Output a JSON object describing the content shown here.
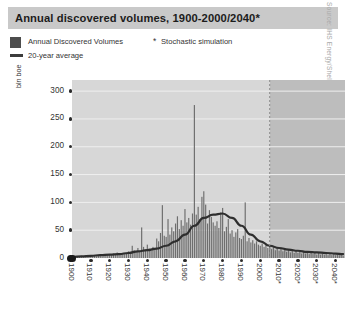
{
  "title": "Annual discovered volumes, 1900-2000/2040*",
  "source": "Source: IHS Energy/Shell",
  "legend": {
    "bar_label": "Annual Discovered Volumes",
    "line_label": "20-year average",
    "note_marker": "*",
    "note_label": "Stochastic simulation",
    "bar_color": "#4d4d4d",
    "line_color": "#3c3c3c"
  },
  "colors": {
    "title_band": "#c9c9c9",
    "plot_history_bg": "#d7d7d7",
    "plot_forecast_bg": "#bdbdbd",
    "gridline": "#efefef",
    "bar": "#6e6e6e",
    "average_line": "#2e2e2e",
    "divider": "#8a8a8a",
    "text": "#333333"
  },
  "chart_data": {
    "type": "bar",
    "title": "Annual discovered volumes, 1900-2000/2040*",
    "xlabel": "",
    "ylabel": "bln boe",
    "ylim": [
      0,
      320
    ],
    "xlim": [
      1900,
      2045
    ],
    "grid": true,
    "legend_position": "above-plot",
    "ytick_labels": [
      "300",
      "250",
      "200",
      "150",
      "100",
      "50",
      "0"
    ],
    "ytick_values": [
      300,
      250,
      200,
      150,
      100,
      50,
      0
    ],
    "xtick_labels": [
      "1900",
      "1910",
      "1920",
      "1930",
      "1940",
      "1950",
      "1960",
      "1970",
      "1980",
      "1990",
      "2000",
      "2010*",
      "2020*",
      "2030*",
      "2040*"
    ],
    "xtick_values": [
      1900,
      1910,
      1920,
      1930,
      1940,
      1950,
      1960,
      1970,
      1980,
      1990,
      2000,
      2010,
      2020,
      2030,
      2040
    ],
    "forecast_start_year": 2005,
    "annotations": [
      {
        "text": "* Stochastic simulation",
        "kind": "footnote"
      }
    ],
    "series": [
      {
        "name": "Annual Discovered Volumes",
        "type": "bar",
        "x": [
          1900,
          1901,
          1902,
          1903,
          1904,
          1905,
          1906,
          1907,
          1908,
          1909,
          1910,
          1911,
          1912,
          1913,
          1914,
          1915,
          1916,
          1917,
          1918,
          1919,
          1920,
          1921,
          1922,
          1923,
          1924,
          1925,
          1926,
          1927,
          1928,
          1929,
          1930,
          1931,
          1932,
          1933,
          1934,
          1935,
          1936,
          1937,
          1938,
          1939,
          1940,
          1941,
          1942,
          1943,
          1944,
          1945,
          1946,
          1947,
          1948,
          1949,
          1950,
          1951,
          1952,
          1953,
          1954,
          1955,
          1956,
          1957,
          1958,
          1959,
          1960,
          1961,
          1962,
          1963,
          1964,
          1965,
          1966,
          1967,
          1968,
          1969,
          1970,
          1971,
          1972,
          1973,
          1974,
          1975,
          1976,
          1977,
          1978,
          1979,
          1980,
          1981,
          1982,
          1983,
          1984,
          1985,
          1986,
          1987,
          1988,
          1989,
          1990,
          1991,
          1992,
          1993,
          1994,
          1995,
          1996,
          1997,
          1998,
          1999,
          2000,
          2001,
          2002,
          2003,
          2004,
          2005,
          2006,
          2007,
          2008,
          2009,
          2010,
          2011,
          2012,
          2013,
          2014,
          2015,
          2016,
          2017,
          2018,
          2019,
          2020,
          2021,
          2022,
          2023,
          2024,
          2025,
          2026,
          2027,
          2028,
          2029,
          2030,
          2031,
          2032,
          2033,
          2034,
          2035,
          2036,
          2037,
          2038,
          2039,
          2040,
          2041,
          2042,
          2043,
          2044
        ],
        "values": [
          2,
          1,
          2,
          3,
          2,
          4,
          3,
          2,
          3,
          4,
          3,
          5,
          4,
          3,
          5,
          4,
          3,
          6,
          4,
          5,
          6,
          5,
          8,
          6,
          10,
          7,
          6,
          9,
          7,
          8,
          12,
          9,
          22,
          14,
          11,
          18,
          13,
          55,
          20,
          15,
          24,
          17,
          13,
          20,
          16,
          35,
          30,
          45,
          95,
          40,
          38,
          70,
          42,
          55,
          48,
          62,
          75,
          52,
          68,
          58,
          88,
          64,
          72,
          60,
          80,
          275,
          78,
          92,
          70,
          110,
          120,
          96,
          62,
          86,
          74,
          64,
          58,
          66,
          54,
          82,
          90,
          48,
          56,
          70,
          44,
          50,
          38,
          46,
          52,
          36,
          34,
          40,
          100,
          30,
          36,
          28,
          32,
          26,
          30,
          24,
          22,
          26,
          20,
          24,
          18,
          22,
          16,
          20,
          14,
          18,
          13,
          17,
          12,
          16,
          11,
          15,
          10,
          14,
          9,
          13,
          9,
          12,
          8,
          11,
          8,
          10,
          7,
          10,
          7,
          9,
          6,
          9,
          6,
          8,
          6,
          8,
          5,
          7,
          5,
          7,
          5,
          6,
          5,
          6,
          4
        ]
      },
      {
        "name": "20-year average",
        "type": "line",
        "x": [
          1900,
          1905,
          1910,
          1915,
          1920,
          1925,
          1930,
          1935,
          1940,
          1945,
          1950,
          1955,
          1960,
          1965,
          1970,
          1975,
          1980,
          1985,
          1990,
          1995,
          2000,
          2005,
          2010,
          2015,
          2020,
          2025,
          2030,
          2035,
          2040,
          2044
        ],
        "values": [
          2,
          3,
          4,
          5,
          6,
          7,
          9,
          12,
          14,
          17,
          22,
          30,
          42,
          58,
          72,
          78,
          80,
          72,
          58,
          42,
          30,
          22,
          18,
          15,
          13,
          11,
          10,
          9,
          8,
          7
        ]
      }
    ]
  }
}
